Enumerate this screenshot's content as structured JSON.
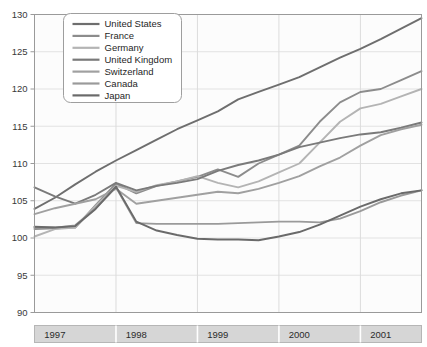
{
  "chart_data": {
    "type": "line",
    "title": "",
    "subtitle": "",
    "xlabel": "",
    "ylabel": "",
    "xlim": [
      1996.75,
      2001.5
    ],
    "ylim": [
      90,
      130
    ],
    "yticks": [
      90,
      95,
      100,
      105,
      110,
      115,
      120,
      125,
      130
    ],
    "xticks": [
      1997,
      1998,
      1999,
      2000,
      2001
    ],
    "xtick_labels": [
      "1997",
      "1998",
      "1999",
      "2000",
      "2001"
    ],
    "ytick_labels": [
      "90",
      "95",
      "100",
      "105",
      "110",
      "115",
      "120",
      "125",
      "130"
    ],
    "grid": true,
    "grid_style": "alternating vertical quarter bands with light horizontal gridlines",
    "legend_position": "upper left",
    "x": [
      1996.75,
      1997.0,
      1997.25,
      1997.5,
      1997.75,
      1998.0,
      1998.25,
      1998.5,
      1998.75,
      1999.0,
      1999.25,
      1999.5,
      1999.75,
      2000.0,
      2000.25,
      2000.5,
      2000.75,
      2001.0,
      2001.25,
      2001.5
    ],
    "series": [
      {
        "name": "United States",
        "color": "#6e6e6e",
        "values": [
          103.9,
          105.4,
          107.2,
          108.9,
          110.4,
          111.8,
          113.2,
          114.6,
          115.8,
          117.0,
          118.6,
          119.6,
          120.6,
          121.6,
          122.9,
          124.2,
          125.4,
          126.7,
          128.1,
          129.5
        ]
      },
      {
        "name": "France",
        "color": "#8c8c8c",
        "values": [
          101.2,
          101.3,
          101.4,
          104.4,
          107.3,
          106.0,
          107.0,
          107.6,
          108.2,
          109.2,
          108.2,
          110.0,
          111.2,
          112.4,
          115.6,
          118.2,
          119.6,
          120.0,
          121.2,
          122.4
        ]
      },
      {
        "name": "Germany",
        "color": "#b4b4b4",
        "values": [
          100.2,
          101.2,
          101.4,
          104.3,
          107.0,
          106.2,
          107.1,
          107.6,
          108.3,
          107.4,
          106.8,
          107.6,
          108.8,
          110.0,
          112.8,
          115.6,
          117.4,
          118.0,
          119.0,
          120.0
        ]
      },
      {
        "name": "United Kingdom",
        "color": "#7a7a7a",
        "values": [
          106.8,
          105.6,
          104.6,
          105.8,
          107.4,
          106.4,
          107.0,
          107.4,
          107.9,
          109.0,
          109.8,
          110.4,
          111.2,
          112.2,
          112.8,
          113.4,
          113.9,
          114.2,
          114.8,
          115.5
        ]
      },
      {
        "name": "Switzerland",
        "color": "#a0a0a0",
        "values": [
          103.2,
          104.0,
          104.6,
          105.2,
          106.6,
          104.6,
          105.0,
          105.4,
          105.8,
          106.2,
          106.0,
          106.6,
          107.4,
          108.3,
          109.6,
          110.8,
          112.4,
          113.8,
          114.6,
          115.2
        ]
      },
      {
        "name": "Canada",
        "color": "#9a9a9a",
        "values": [
          101.4,
          101.4,
          101.7,
          104.0,
          106.8,
          102.0,
          101.9,
          101.9,
          101.9,
          101.9,
          102.0,
          102.1,
          102.2,
          102.2,
          102.1,
          102.6,
          103.6,
          104.8,
          105.7,
          106.4
        ]
      },
      {
        "name": "Japan",
        "color": "#6a6a6a",
        "values": [
          101.5,
          101.4,
          101.6,
          103.9,
          106.9,
          102.2,
          101.0,
          100.4,
          99.9,
          99.8,
          99.8,
          99.7,
          100.2,
          100.8,
          101.8,
          103.0,
          104.2,
          105.2,
          106.0,
          106.4
        ]
      }
    ]
  },
  "legend": {
    "items": [
      {
        "label": "United States"
      },
      {
        "label": "France"
      },
      {
        "label": "Germany"
      },
      {
        "label": "United Kingdom"
      },
      {
        "label": "Switzerland"
      },
      {
        "label": "Canada"
      },
      {
        "label": "Japan"
      }
    ]
  },
  "style": {
    "plot_background": "#fcfcfc",
    "band_color": "#ededed",
    "gridline_color": "#e2e2e2",
    "axis_color": "#9a9a9a",
    "xaxis_band_color": "#d6d6d6",
    "legend_background": "#ffffff",
    "legend_border": "#9e9e9e"
  }
}
